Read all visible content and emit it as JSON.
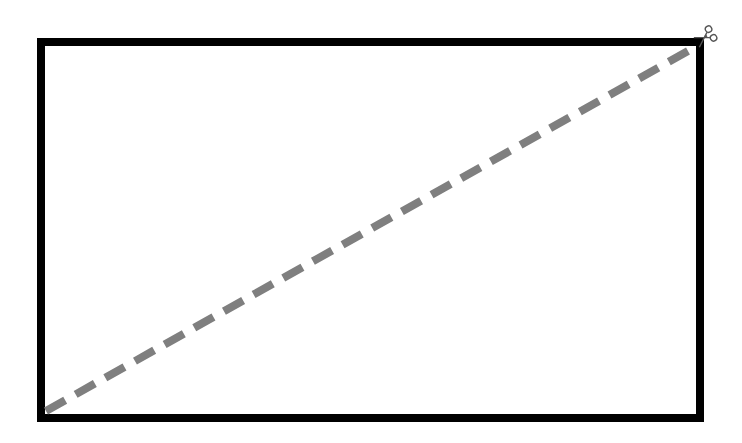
{
  "diagram": {
    "background_color": "#ffffff",
    "rectangle": {
      "x": 41,
      "y": 42,
      "width": 659,
      "height": 376,
      "stroke_color": "#000000",
      "stroke_width": 8
    },
    "cut_line": {
      "x1": 46,
      "y1": 411,
      "x2": 697,
      "y2": 46,
      "stroke_color": "#7f7f7f",
      "stroke_width": 8,
      "dash_length": 22,
      "gap_length": 12,
      "style": "dashed"
    },
    "scissors": {
      "icon": "scissors-icon",
      "x": 705,
      "y": 37,
      "color": "#555555"
    }
  }
}
